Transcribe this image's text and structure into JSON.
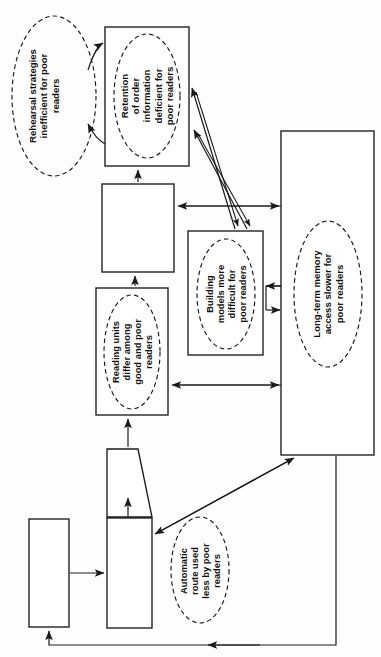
{
  "diagram": {
    "orientation": "rotated-90-counterclockwise",
    "colors": {
      "stroke": "#1a1a1a",
      "fill": "#ffffff",
      "text": "#111111",
      "background": "#fefefe"
    },
    "annotations": [
      {
        "id": "rehearsal",
        "shape": "dashed-ellipse",
        "text": "Rehearsal strategies\ninefficient for poor\nreaders",
        "line1": "Rehearsal  strategies",
        "line2": "inefficient for poor",
        "line3": "readers"
      },
      {
        "id": "retention",
        "shape": "dashed-ellipse-in-box",
        "text": "Retention\nof order\ninformation\ndeficient for\npoor readers",
        "line1": "Retention",
        "line2": "of order",
        "line3": "information",
        "line4": "deficient for",
        "line5": "poor readers"
      },
      {
        "id": "reading-units",
        "shape": "dashed-ellipse-in-box",
        "text": "Reading units\ndiffer among\ngood and poor\nreaders",
        "line1": "Reading units",
        "line2": "differ among",
        "line3": "good and poor",
        "line4": "readers"
      },
      {
        "id": "building-models",
        "shape": "dashed-ellipse-in-box",
        "text": "Building\nmodels more\ndifficult for\npoor readers",
        "line1": "Building",
        "line2": "models  more",
        "line3": "difficult  for",
        "line4": "poor readers"
      },
      {
        "id": "long-term-memory",
        "shape": "dashed-ellipse-in-box",
        "text": "Long-term memory\naccess slower for\npoor readers",
        "line1": "Long-term memory",
        "line2": "access slower for",
        "line3": "poor readers"
      },
      {
        "id": "automatic-route",
        "shape": "dashed-ellipse",
        "text": "Automatic\nroute used\nless by poor\nreaders",
        "line1": "Automatic",
        "line2": "route used",
        "line3": "less by poor",
        "line4": "readers"
      }
    ],
    "boxes": [
      {
        "id": "retention-box",
        "label": ""
      },
      {
        "id": "middle-empty-box",
        "label": ""
      },
      {
        "id": "reading-units-box",
        "label": ""
      },
      {
        "id": "building-models-box",
        "label": ""
      },
      {
        "id": "long-term-memory-box",
        "label": ""
      },
      {
        "id": "trapezoid-box",
        "label": ""
      },
      {
        "id": "lower-stem-box",
        "label": ""
      },
      {
        "id": "input-box",
        "label": ""
      }
    ]
  }
}
